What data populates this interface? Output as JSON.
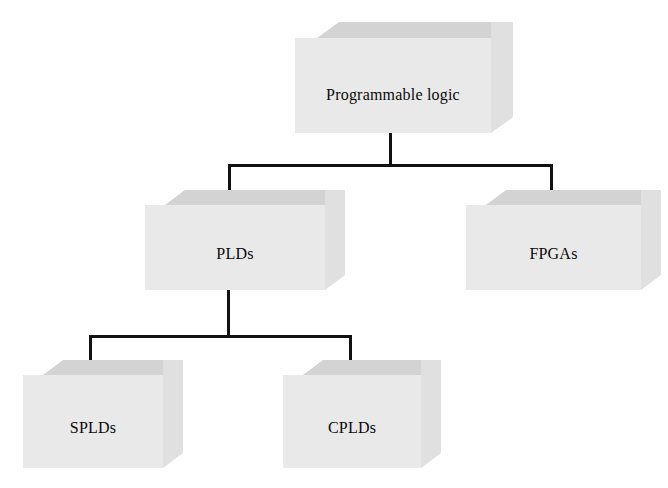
{
  "diagram": {
    "type": "hierarchy-tree",
    "orientation": "top-down",
    "style": "3d-isometric-boxes",
    "background_color": "#ffffff",
    "box_front_color": "#e9e9e9",
    "box_top_color": "#d3d3d3",
    "box_side_color": "#e0e0e0",
    "connector_color": "#111111",
    "nodes": [
      {
        "id": "programmable-logic",
        "label": "Programmable logic",
        "level": 0,
        "x": 295,
        "y": 38,
        "w": 196,
        "h": 95,
        "depth_x": 22,
        "depth_y": 16,
        "font_size": 16,
        "label_y": 46
      },
      {
        "id": "plds",
        "label": "PLDs",
        "level": 1,
        "x": 145,
        "y": 205,
        "w": 180,
        "h": 85,
        "depth_x": 20,
        "depth_y": 15,
        "font_size": 16,
        "label_y": 40
      },
      {
        "id": "fpgas",
        "label": "FPGAs",
        "level": 1,
        "x": 466,
        "y": 205,
        "w": 175,
        "h": 85,
        "depth_x": 20,
        "depth_y": 15,
        "font_size": 16,
        "label_y": 40
      },
      {
        "id": "splds",
        "label": "SPLDs",
        "level": 2,
        "x": 23,
        "y": 375,
        "w": 140,
        "h": 93,
        "depth_x": 20,
        "depth_y": 15,
        "font_size": 16,
        "label_y": 44
      },
      {
        "id": "cplds",
        "label": "CPLDs",
        "level": 2,
        "x": 283,
        "y": 375,
        "w": 138,
        "h": 93,
        "depth_x": 20,
        "depth_y": 15,
        "font_size": 16,
        "label_y": 44
      }
    ],
    "edges": [
      {
        "id": "edge-root-to-plds",
        "from": "programmable-logic",
        "to": "plds",
        "arrow": true
      },
      {
        "id": "edge-root-to-fpgas",
        "from": "programmable-logic",
        "to": "fpgas",
        "arrow": true
      },
      {
        "id": "edge-plds-to-splds",
        "from": "plds",
        "to": "splds",
        "arrow": true
      },
      {
        "id": "edge-plds-to-cplds",
        "from": "plds",
        "to": "cplds",
        "arrow": true
      }
    ]
  }
}
